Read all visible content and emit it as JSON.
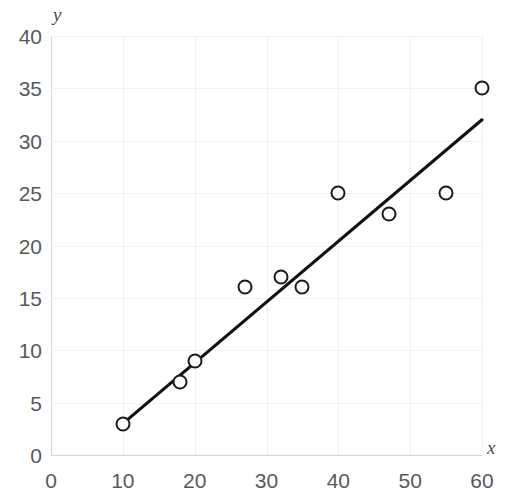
{
  "chart_data": {
    "type": "scatter",
    "title": "",
    "xlabel": "x",
    "ylabel": "y",
    "xlim": [
      0,
      60
    ],
    "ylim": [
      0,
      40
    ],
    "x_ticks": [
      0,
      10,
      20,
      30,
      40,
      50,
      60
    ],
    "y_ticks": [
      0,
      5,
      10,
      15,
      20,
      25,
      30,
      35,
      40
    ],
    "grid": true,
    "legend": "none",
    "series": [
      {
        "name": "data points",
        "marker": "open-circle",
        "color": "#1a1a1a",
        "points": [
          {
            "x": 10,
            "y": 3
          },
          {
            "x": 18,
            "y": 7
          },
          {
            "x": 20,
            "y": 9
          },
          {
            "x": 27,
            "y": 16
          },
          {
            "x": 32,
            "y": 17
          },
          {
            "x": 35,
            "y": 16
          },
          {
            "x": 40,
            "y": 25
          },
          {
            "x": 47,
            "y": 23
          },
          {
            "x": 55,
            "y": 25
          },
          {
            "x": 60,
            "y": 35
          }
        ]
      },
      {
        "name": "trend line",
        "type": "line",
        "color": "#111111",
        "endpoints": [
          {
            "x": 10,
            "y": 3
          },
          {
            "x": 60,
            "y": 32
          }
        ]
      }
    ]
  },
  "axis_titles": {
    "y": "y",
    "x": "x"
  },
  "colors": {
    "marker_stroke": "#1a1a1a",
    "trendline": "#111111",
    "gridline": "#f0f0f0",
    "axis": "#d4d4d4",
    "tick_text": "#58595b",
    "background": "#ffffff"
  }
}
